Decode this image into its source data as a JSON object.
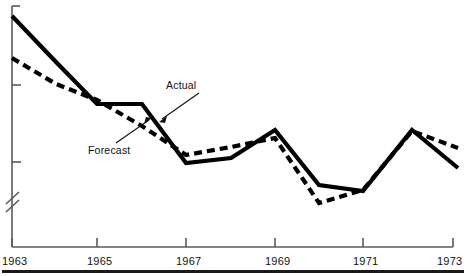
{
  "chart_data": {
    "type": "line",
    "title": "",
    "subtitle": "",
    "xlabel": "",
    "ylabel": "",
    "grid": false,
    "legend_position": "inline-annotation",
    "y_axis": {
      "has_break": true,
      "break_symbol": "//",
      "tick_labels": [],
      "ticks_visible": 2,
      "range_labeled": false
    },
    "x": [
      1963,
      1964,
      1965,
      1966,
      1967,
      1968,
      1969,
      1970,
      1971,
      1972,
      1973
    ],
    "categories": [
      "1963",
      "1964",
      "1965",
      "1966",
      "1967",
      "1968",
      "1969",
      "1970",
      "1971",
      "1972",
      "1973"
    ],
    "xlim": [
      1963,
      1973
    ],
    "x_tick_labels": [
      "1963",
      "1965",
      "1967",
      "1969",
      "1971",
      "1973"
    ],
    "x_tick_values": [
      1963,
      1965,
      1967,
      1969,
      1971,
      1973
    ],
    "series": [
      {
        "name": "Actual",
        "style": "solid",
        "color": "#000000",
        "values": [
          92,
          78,
          61,
          61,
          38,
          40,
          54,
          27,
          24,
          55,
          35
        ],
        "pixel_points": [
          [
            12,
            16
          ],
          [
            56,
            62
          ],
          [
            97,
            104
          ],
          [
            142,
            104
          ],
          [
            186,
            163
          ],
          [
            231,
            158
          ],
          [
            275,
            130
          ],
          [
            319,
            185
          ],
          [
            363,
            191
          ],
          [
            412,
            130
          ],
          [
            458,
            168
          ]
        ]
      },
      {
        "name": "Forecast",
        "style": "dashed",
        "color": "#000000",
        "values": [
          78,
          71,
          63,
          53,
          42,
          46,
          50,
          21,
          25,
          55,
          43
        ],
        "pixel_points": [
          [
            12,
            58
          ],
          [
            56,
            84
          ],
          [
            97,
            100
          ],
          [
            142,
            126
          ],
          [
            186,
            155
          ],
          [
            231,
            147
          ],
          [
            275,
            138
          ],
          [
            319,
            203
          ],
          [
            363,
            190
          ],
          [
            412,
            131
          ],
          [
            458,
            148
          ]
        ]
      }
    ],
    "annotations": [
      {
        "text": "Actual",
        "target_series": "Actual",
        "label_x": 166,
        "label_y": 79,
        "leader_from": [
          199,
          93
        ],
        "leader_to": [
          159,
          122
        ]
      },
      {
        "text": "Forecast",
        "target_series": "Forecast",
        "label_x": 88,
        "label_y": 144,
        "leader_from": [
          116,
          143
        ],
        "leader_to": [
          152,
          118
        ]
      }
    ]
  },
  "axis": {
    "x_ticks": [
      {
        "label": "1963",
        "px": 12
      },
      {
        "label": "1965",
        "px": 97
      },
      {
        "label": "1967",
        "px": 186
      },
      {
        "label": "1969",
        "px": 275
      },
      {
        "label": "1971",
        "px": 363
      },
      {
        "label": "1973",
        "px": 453
      }
    ]
  },
  "labels": {
    "actual": "Actual",
    "forecast": "Forecast",
    "tick_1963": "1963",
    "tick_1965": "1965",
    "tick_1967": "1967",
    "tick_1969": "1969",
    "tick_1971": "1971",
    "tick_1973": "1973"
  },
  "colors": {
    "line": "#000000",
    "axis": "#555555",
    "text": "#111111",
    "rule": "#1a1a1a",
    "background": "#ffffff"
  }
}
